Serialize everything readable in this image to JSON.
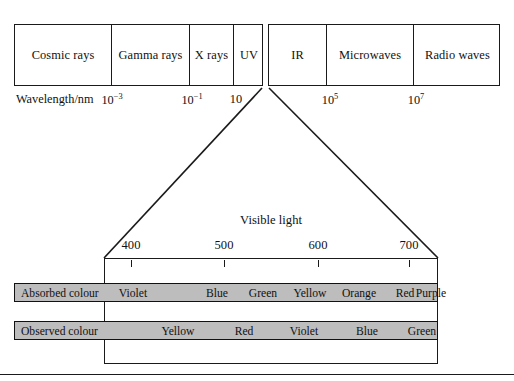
{
  "figure": {
    "bottom_rule": true
  },
  "em_spectrum": {
    "left_group": [
      {
        "label": "Cosmic rays",
        "left": 0,
        "width": 96
      },
      {
        "label": "Gamma rays",
        "left": 96,
        "width": 78
      },
      {
        "label": "X rays",
        "left": 174,
        "width": 44
      },
      {
        "label": "UV",
        "left": 218,
        "width": 31
      }
    ],
    "right_group": [
      {
        "label": "IR",
        "left": 0,
        "width": 57
      },
      {
        "label": "Microwaves",
        "left": 57,
        "width": 87
      },
      {
        "label": "Radio waves",
        "left": 144,
        "width": 88
      }
    ]
  },
  "wavelength_axis": {
    "axis_label": "Wavelength/nm",
    "ticks": [
      {
        "mantissa": "10",
        "exponent": "−3",
        "x": 112
      },
      {
        "mantissa": "10",
        "exponent": "−1",
        "x": 192
      },
      {
        "mantissa": "10",
        "exponent": "",
        "x": 236
      },
      {
        "mantissa": "10",
        "exponent": "5",
        "x": 330
      },
      {
        "mantissa": "10",
        "exponent": "7",
        "x": 416
      }
    ]
  },
  "visible_light": {
    "title": "Visible light",
    "scale_unit": "nm",
    "ticks": [
      {
        "label": "400",
        "x": 131
      },
      {
        "label": "500",
        "x": 224
      },
      {
        "label": "600",
        "x": 318
      },
      {
        "label": "700",
        "x": 409
      }
    ],
    "funnel": {
      "top_left_x": 262,
      "top_right_x": 269,
      "top_y": 88,
      "bottom_left_x": 104,
      "bottom_right_x": 438,
      "bottom_y": 258
    }
  },
  "colour_bars": {
    "bar_fill": "#bdbdbd",
    "absorbed": {
      "title": "Absorbed colour",
      "items": [
        {
          "label": "Violet",
          "x": 132
        },
        {
          "label": "Blue",
          "x": 216
        },
        {
          "label": "Green",
          "x": 262
        },
        {
          "label": "Yellow",
          "x": 309
        },
        {
          "label": "Orange",
          "x": 358
        },
        {
          "label": "Red",
          "x": 404
        },
        {
          "label": "Purple",
          "x": 430
        }
      ]
    },
    "observed": {
      "title": "Observed colour",
      "items": [
        {
          "label": "Yellow",
          "x": 177
        },
        {
          "label": "Red",
          "x": 243
        },
        {
          "label": "Violet",
          "x": 303
        },
        {
          "label": "Blue",
          "x": 366
        },
        {
          "label": "Green",
          "x": 421
        }
      ]
    }
  }
}
